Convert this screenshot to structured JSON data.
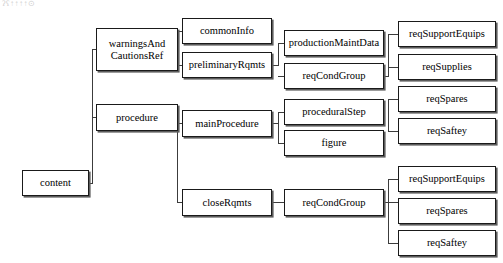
{
  "diagram": {
    "type": "hierarchical-tree",
    "title_artifact": "ʔʕ↑↑↑↑⊙",
    "canvas": {
      "width": 503,
      "height": 263,
      "background": "#ffffff"
    },
    "style": {
      "box_border_color": "#1a1a1a",
      "box_shadow_color": "#5c5c5c",
      "box_fill": "#ffffff",
      "connector_color": "#3c3c3c",
      "text_color": "#000000"
    },
    "nodes": [
      {
        "id": "content",
        "label": "content",
        "x": 22,
        "y": 170,
        "w": 67,
        "h": 26,
        "level": 0
      },
      {
        "id": "warningsAndCautionsRef",
        "label": "warningsAnd\nCautionsRef",
        "x": 96,
        "y": 28,
        "w": 82,
        "h": 43,
        "level": 1
      },
      {
        "id": "procedure",
        "label": "procedure",
        "x": 96,
        "y": 104,
        "w": 82,
        "h": 27,
        "level": 1
      },
      {
        "id": "commonInfo",
        "label": "commonInfo",
        "x": 182,
        "y": 18,
        "w": 90,
        "h": 26,
        "level": 2
      },
      {
        "id": "preliminaryRqmts",
        "label": "preliminaryRqmts",
        "x": 182,
        "y": 52,
        "w": 90,
        "h": 26,
        "level": 2
      },
      {
        "id": "mainProcedure",
        "label": "mainProcedure",
        "x": 182,
        "y": 110,
        "w": 90,
        "h": 27,
        "level": 2
      },
      {
        "id": "closeRqmts",
        "label": "closeRqmts",
        "x": 182,
        "y": 189,
        "w": 90,
        "h": 27,
        "level": 2
      },
      {
        "id": "productionMaintData",
        "label": "productionMaintData",
        "x": 284,
        "y": 30,
        "w": 100,
        "h": 26,
        "level": 3
      },
      {
        "id": "reqCondGroup-1",
        "label": "reqCondGroup",
        "x": 284,
        "y": 63,
        "w": 100,
        "h": 26,
        "level": 3
      },
      {
        "id": "proceduralStep",
        "label": "proceduralStep",
        "x": 284,
        "y": 99,
        "w": 100,
        "h": 26,
        "level": 3
      },
      {
        "id": "figure",
        "label": "figure",
        "x": 284,
        "y": 130,
        "w": 100,
        "h": 26,
        "level": 3
      },
      {
        "id": "reqCondGroup-2",
        "label": "reqCondGroup",
        "x": 284,
        "y": 189,
        "w": 100,
        "h": 27,
        "level": 3
      },
      {
        "id": "reqSupportEquips-1",
        "label": "reqSupportEquips",
        "x": 398,
        "y": 21,
        "w": 98,
        "h": 26,
        "level": 4
      },
      {
        "id": "reqSupplies",
        "label": "reqSupplies",
        "x": 398,
        "y": 54,
        "w": 98,
        "h": 26,
        "level": 4
      },
      {
        "id": "reqSpares-1",
        "label": "reqSpares",
        "x": 398,
        "y": 86,
        "w": 98,
        "h": 26,
        "level": 4
      },
      {
        "id": "reqSaftey-1",
        "label": "reqSaftey",
        "x": 398,
        "y": 118,
        "w": 98,
        "h": 26,
        "level": 4
      },
      {
        "id": "reqSupportEquips-2",
        "label": "reqSupportEquips",
        "x": 398,
        "y": 166,
        "w": 98,
        "h": 26,
        "level": 4
      },
      {
        "id": "reqSpares-2",
        "label": "reqSpares",
        "x": 398,
        "y": 198,
        "w": 98,
        "h": 26,
        "level": 4
      },
      {
        "id": "reqSaftey-2",
        "label": "reqSaftey",
        "x": 398,
        "y": 230,
        "w": 98,
        "h": 26,
        "level": 4
      }
    ],
    "edges": [
      {
        "from": "content",
        "to": "warningsAndCautionsRef"
      },
      {
        "from": "content",
        "to": "procedure"
      },
      {
        "from": "warningsAndCautionsRef",
        "to": "commonInfo"
      },
      {
        "from": "warningsAndCautionsRef",
        "to": "preliminaryRqmts"
      },
      {
        "from": "procedure",
        "to": "mainProcedure"
      },
      {
        "from": "procedure",
        "to": "closeRqmts"
      },
      {
        "from": "preliminaryRqmts",
        "to": "productionMaintData"
      },
      {
        "from": "preliminaryRqmts",
        "to": "reqCondGroup-1"
      },
      {
        "from": "mainProcedure",
        "to": "proceduralStep"
      },
      {
        "from": "mainProcedure",
        "to": "figure"
      },
      {
        "from": "closeRqmts",
        "to": "reqCondGroup-2"
      },
      {
        "from": "reqCondGroup-1",
        "to": "reqSupportEquips-1"
      },
      {
        "from": "reqCondGroup-1",
        "to": "reqSupplies"
      },
      {
        "from": "reqCondGroup-1",
        "to": "reqSpares-1"
      },
      {
        "from": "reqCondGroup-1",
        "to": "reqSaftey-1"
      },
      {
        "from": "reqCondGroup-2",
        "to": "reqSupportEquips-2"
      },
      {
        "from": "reqCondGroup-2",
        "to": "reqSpares-2"
      },
      {
        "from": "reqCondGroup-2",
        "to": "reqSaftey-2"
      }
    ],
    "connector_paths": [
      "M89,183 L92,183 L92,49.5 L96,49.5",
      "M92,117.5 L96,117.5",
      "M178,49.5 L177,49.5 L177,31 L182,31",
      "M177,65 L182,65",
      "M178,117.5 L177,117.5 L177,123.5 L182,123.5",
      "M177,123.5 L177,202.5 L182,202.5",
      "M272,65 L278,65 L278,43 L284,43",
      "M278,76 L284,76",
      "M272,123.5 L278,123.5 L278,112 L284,112",
      "M278,123.5 L278,143 L284,143",
      "M272,202.5 L284,202.5",
      "M384,76 L388,76 L388,34 L398,34",
      "M388,67 L398,67",
      "M388,99 L398,99",
      "M388,99 L388,131 L398,131",
      "M384,202.5 L388,202.5 L388,179 L398,179",
      "M388,202.5 L398,202.5",
      "M388,202.5 L388,243 L398,243"
    ]
  }
}
